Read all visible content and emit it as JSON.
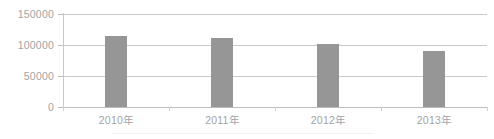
{
  "chart_data": {
    "type": "bar",
    "title": "",
    "subtitle": "",
    "xlabel": "",
    "ylabel": "",
    "categories": [
      "2010年",
      "2011年",
      "2012年",
      "2013年"
    ],
    "values": [
      114500,
      111000,
      101000,
      90000
    ],
    "series": [
      {
        "name": "",
        "values": [
          114500,
          111000,
          101000,
          90000
        ]
      }
    ],
    "ylim": [
      0,
      150000
    ],
    "yticks": [
      0,
      50000,
      100000,
      150000
    ],
    "ytick_labels": [
      "0",
      "50000",
      "100000",
      "150000"
    ],
    "grid": true,
    "legend": false,
    "legend_position": "none",
    "annotations": [],
    "colors": {
      "bar_fill": "#969696",
      "gridline": "#c9c9c9",
      "axis_line": "#bdbdbd",
      "tick_label": "#a3a3a3",
      "background": "#ffffff"
    }
  },
  "axes": {
    "y": {
      "ticks": [
        {
          "label": "150000",
          "value": 150000
        },
        {
          "label": "100000",
          "value": 100000
        },
        {
          "label": "50000",
          "value": 50000
        },
        {
          "label": "0",
          "value": 0
        }
      ]
    },
    "x": {
      "ticks": [
        {
          "label": "2010年"
        },
        {
          "label": "2011年"
        },
        {
          "label": "2012年"
        },
        {
          "label": "2013年"
        }
      ]
    }
  }
}
